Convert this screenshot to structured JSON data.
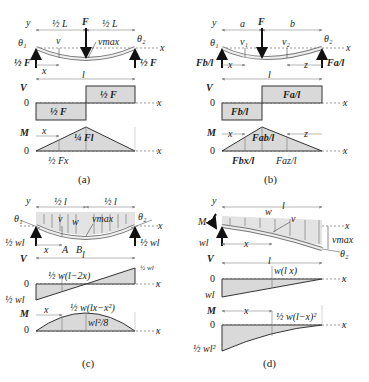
{
  "figure": {
    "fill_color": "#d9d9d9",
    "line_color": "#333333",
    "panels": [
      {
        "id": "a",
        "caption": "(a)",
        "beam": {
          "labels": {
            "y": "y",
            "x": "x",
            "half_L_left": "½ L",
            "half_L_right": "½ L",
            "load": "F",
            "theta1": "θ₁",
            "theta2": "θ₂",
            "v": "v",
            "vmax": "vmax",
            "reaction_left": "½ F",
            "reaction_right": "½ F",
            "x_dim": "x"
          }
        },
        "shear": {
          "axis": "V",
          "zero": "0",
          "x": "x",
          "span": "l",
          "pos_label": "½ F",
          "neg_label": "½ F"
        },
        "moment": {
          "axis": "M",
          "zero": "0",
          "x": "x",
          "x_dim": "x",
          "peak_label": "¼ Fl",
          "at_x_label": "½ Fx"
        }
      },
      {
        "id": "b",
        "caption": "(b)",
        "beam": {
          "labels": {
            "y": "y",
            "x": "x",
            "a": "a",
            "b": "b",
            "load": "F",
            "theta1": "θ₁",
            "theta2": "θ₂",
            "v1": "v₁",
            "v2": "v₂",
            "reaction_left": "Fb/l",
            "reaction_right": "Fa/l",
            "x_dim": "x",
            "z_dim": "z"
          }
        },
        "shear": {
          "axis": "V",
          "zero": "0",
          "x": "x",
          "span": "l",
          "pos_label": "Fa/l",
          "neg_label": "Fb/l"
        },
        "moment": {
          "axis": "M",
          "zero": "0",
          "x": "x",
          "x_dim": "x",
          "z_dim": "z",
          "peak_label": "Fab/l",
          "at_x_label": "Fbx/l",
          "at_z_label": "Faz/l"
        }
      },
      {
        "id": "c",
        "caption": "(c)",
        "beam": {
          "labels": {
            "y": "y",
            "x": "x",
            "half_l_left": "½ l",
            "half_l_right": "½ l",
            "w": "w",
            "theta1": "θ₁",
            "theta2": "θ₂",
            "v": "v",
            "vmax": "vmax",
            "reaction_left": "½ wl",
            "reaction_right": "½ wl",
            "x_dim": "x",
            "A": "A",
            "B": "B"
          }
        },
        "shear": {
          "axis": "V",
          "zero": "0",
          "x": "x",
          "span": "l",
          "expr": "½ w(l−2x)",
          "top_label": "½ wl",
          "bottom_label": "½ wl"
        },
        "moment": {
          "axis": "M",
          "zero": "0",
          "x": "x",
          "x_dim": "x",
          "expr": "½ w(lx−x²)",
          "peak_label": "wl²/8"
        }
      },
      {
        "id": "d",
        "caption": "(d)",
        "beam": {
          "labels": {
            "y": "y",
            "x": "x",
            "span": "l",
            "w": "w",
            "M": "M",
            "theta2": "θ₂",
            "v": "v",
            "vmax": "vmax",
            "reaction": "wl",
            "x_dim": "x"
          }
        },
        "shear": {
          "axis": "V",
          "zero": "0",
          "x": "x",
          "span": "l",
          "expr": "w(l x)",
          "bottom_label": "wl"
        },
        "moment": {
          "axis": "M",
          "zero": "0",
          "x": "x",
          "x_dim": "x",
          "expr": "½ w(l−x)²",
          "bottom_label": "½ wl²"
        }
      }
    ]
  }
}
